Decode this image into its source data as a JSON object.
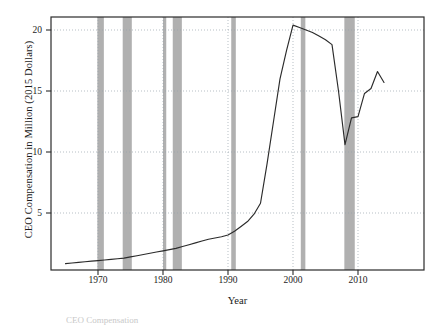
{
  "chart_data": {
    "type": "line",
    "title": "",
    "xlabel": "Year",
    "ylabel": "CEO Compensation in Million (2015 Dollars)",
    "xlim": [
      1964,
      1975
    ],
    "ylim": [
      0.4,
      21.3
    ],
    "xticks": [
      1970,
      1980,
      1990,
      2000,
      2010
    ],
    "xtick_labels": [
      "1970",
      "1980",
      "1990",
      "2000",
      "2010"
    ],
    "yticks": [
      5,
      10,
      15,
      20
    ],
    "ytick_labels": [
      "5",
      "10",
      "15",
      "20"
    ],
    "grid": "dotted horizontal and vertical gridlines at ticks",
    "legend": "none",
    "x": [
      1965,
      1966,
      1967,
      1968,
      1969,
      1970,
      1971,
      1972,
      1973,
      1974,
      1975,
      1976,
      1977,
      1978,
      1979,
      1980,
      1981,
      1982,
      1983,
      1984,
      1985,
      1986,
      1987,
      1988,
      1989,
      1990,
      1991,
      1992,
      1993,
      1994,
      1995,
      1996,
      1997,
      1998,
      1999,
      2000,
      2001,
      2002,
      2003,
      2004,
      2005,
      2006,
      2007,
      2008,
      2009,
      2010,
      2011,
      2012,
      2013,
      2014
    ],
    "values": [
      0.85,
      0.9,
      0.95,
      1.0,
      1.05,
      1.1,
      1.15,
      1.2,
      1.25,
      1.3,
      1.4,
      1.5,
      1.6,
      1.7,
      1.8,
      1.9,
      2.0,
      2.1,
      2.25,
      2.4,
      2.55,
      2.7,
      2.85,
      2.95,
      3.05,
      3.2,
      3.5,
      3.9,
      4.3,
      4.9,
      5.8,
      9.0,
      12.5,
      16.0,
      18.3,
      20.4,
      20.2,
      20.0,
      19.8,
      19.5,
      19.2,
      18.8,
      15.0,
      10.6,
      12.8,
      12.9,
      14.8,
      15.2,
      16.6,
      15.7
    ],
    "series_color": "#2b2b2b",
    "recession_color": "#b0b0b0",
    "recessions": [
      {
        "start": 1969.9,
        "end": 1970.9
      },
      {
        "start": 1973.8,
        "end": 1975.2
      },
      {
        "start": 1980.0,
        "end": 1980.5
      },
      {
        "start": 1981.5,
        "end": 1982.9
      },
      {
        "start": 1990.5,
        "end": 1991.2
      },
      {
        "start": 2001.2,
        "end": 2001.9
      },
      {
        "start": 2007.9,
        "end": 2009.5
      }
    ]
  },
  "caption": "CEO Compensation"
}
